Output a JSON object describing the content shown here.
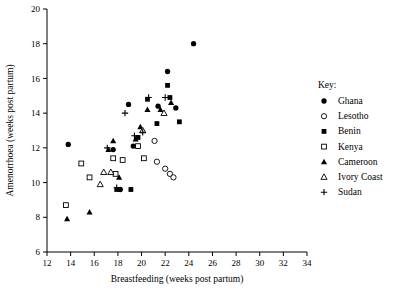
{
  "chart_data": {
    "type": "scatter",
    "title": "",
    "xlabel": "Breastfeeding (weeks post partum)",
    "ylabel": "Amenorrhoea (weeks post partum)",
    "xlim": [
      12,
      34
    ],
    "ylim": [
      6,
      20
    ],
    "xticks": [
      12,
      14,
      16,
      18,
      20,
      22,
      24,
      26,
      28,
      30,
      32,
      34
    ],
    "yticks": [
      6,
      8,
      10,
      12,
      14,
      16,
      18,
      20
    ],
    "grid": false,
    "legend_position": "right",
    "legend_title": "Key:",
    "series": [
      {
        "name": "Ghana",
        "marker": "filled-circle",
        "color": "#000000",
        "points": [
          [
            13.8,
            12.2
          ],
          [
            17.6,
            11.9
          ],
          [
            18.2,
            9.6
          ],
          [
            18.9,
            14.5
          ],
          [
            19.3,
            12.1
          ],
          [
            21.4,
            14.4
          ],
          [
            22.2,
            16.4
          ],
          [
            22.9,
            14.3
          ],
          [
            24.4,
            18.0
          ]
        ]
      },
      {
        "name": "Lesotho",
        "marker": "open-circle",
        "color": "#000000",
        "points": [
          [
            21.1,
            12.4
          ],
          [
            21.3,
            11.2
          ],
          [
            22.0,
            10.8
          ],
          [
            22.4,
            10.5
          ],
          [
            22.7,
            10.3
          ]
        ]
      },
      {
        "name": "Benin",
        "marker": "filled-square",
        "color": "#000000",
        "points": [
          [
            17.9,
            9.6
          ],
          [
            19.1,
            9.6
          ],
          [
            19.7,
            12.6
          ],
          [
            20.5,
            14.8
          ],
          [
            21.3,
            13.4
          ],
          [
            22.2,
            15.6
          ],
          [
            22.4,
            14.9
          ],
          [
            23.2,
            13.5
          ]
        ]
      },
      {
        "name": "Kenya",
        "marker": "open-square",
        "color": "#000000",
        "points": [
          [
            13.6,
            8.7
          ],
          [
            14.9,
            11.1
          ],
          [
            15.6,
            10.3
          ],
          [
            17.6,
            11.4
          ],
          [
            18.4,
            11.3
          ],
          [
            17.8,
            10.5
          ],
          [
            19.7,
            12.1
          ],
          [
            20.2,
            11.4
          ]
        ]
      },
      {
        "name": "Cameroon",
        "marker": "filled-triangle",
        "color": "#000000",
        "points": [
          [
            13.7,
            7.9
          ],
          [
            15.6,
            8.3
          ],
          [
            17.2,
            11.9
          ],
          [
            17.6,
            12.4
          ],
          [
            18.1,
            10.3
          ],
          [
            19.5,
            12.5
          ],
          [
            19.9,
            13.2
          ],
          [
            20.5,
            14.2
          ],
          [
            21.6,
            14.2
          ],
          [
            22.5,
            14.6
          ]
        ]
      },
      {
        "name": "Ivory Coast",
        "marker": "open-triangle",
        "color": "#000000",
        "points": [
          [
            16.8,
            10.6
          ],
          [
            17.4,
            10.6
          ],
          [
            16.5,
            9.9
          ],
          [
            20.1,
            13.0
          ],
          [
            21.9,
            14.0
          ]
        ]
      },
      {
        "name": "Sudan",
        "marker": "plus",
        "color": "#000000",
        "points": [
          [
            17.1,
            12.0
          ],
          [
            17.9,
            9.7
          ],
          [
            18.6,
            14.0
          ],
          [
            19.4,
            12.7
          ],
          [
            20.1,
            12.9
          ],
          [
            20.6,
            14.9
          ],
          [
            22.0,
            14.9
          ]
        ]
      }
    ]
  }
}
